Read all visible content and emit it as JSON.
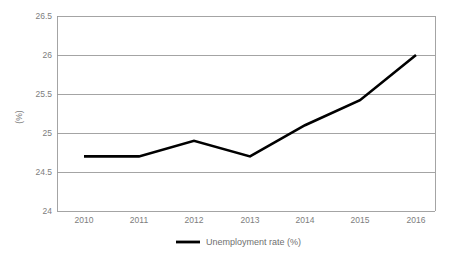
{
  "chart_data": {
    "type": "line",
    "title": "",
    "subtitle": "",
    "xlabel": "",
    "ylabel": "(%)",
    "categories": [
      "2010",
      "2011",
      "2012",
      "2013",
      "2014",
      "2015",
      "2016"
    ],
    "x": [
      2010,
      2011,
      2012,
      2013,
      2014,
      2015,
      2016
    ],
    "series": [
      {
        "name": "Unemployment rate (%)",
        "values": [
          24.7,
          24.7,
          24.9,
          24.7,
          25.1,
          25.42,
          26.0
        ],
        "color": "#000000"
      }
    ],
    "ylim": [
      24,
      26.5
    ],
    "yticks": [
      "24",
      "24.5",
      "25",
      "25.5",
      "26",
      "26.5"
    ],
    "ytick_values": [
      24,
      24.5,
      25,
      25.5,
      26,
      26.5
    ],
    "xticks": [
      "2010",
      "2011",
      "2012",
      "2013",
      "2014",
      "2015",
      "2016"
    ],
    "grid": "horizontal",
    "legend_position": "bottom",
    "legend_entries": [
      "Unemployment rate (%)"
    ],
    "background_color": "#ffffff",
    "gridline_color": "#9a9a9a",
    "tick_label_color": "#7d7d7d"
  },
  "legend": {
    "entry_label": "Unemployment rate (%)"
  },
  "axes": {
    "y_title": "(%)"
  }
}
